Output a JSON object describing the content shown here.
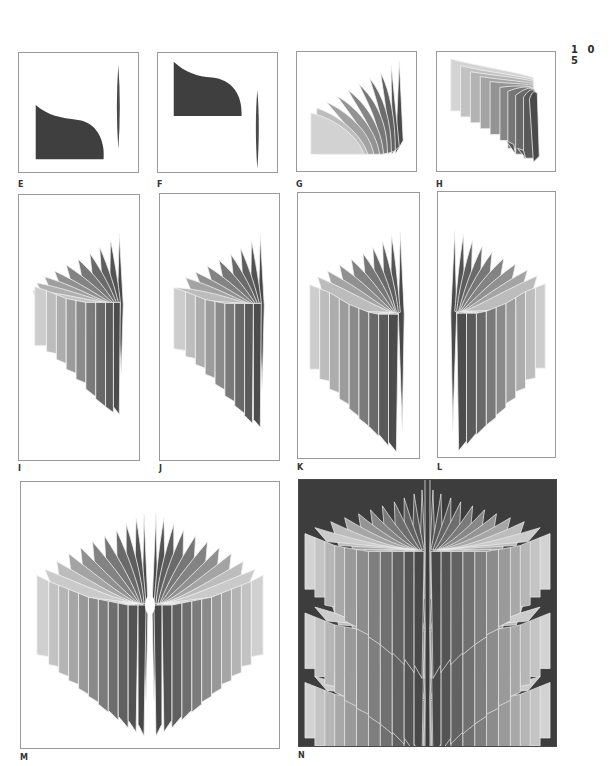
{
  "page": {
    "number": "1 0 5"
  },
  "figures": [
    {
      "id": "E",
      "label": "E",
      "description": "Dark solid curved silhouette with thin vertical spindle to the right"
    },
    {
      "id": "F",
      "label": "F",
      "description": "Dark solid curved silhouette (raised) with thin vertical spindle lower right"
    },
    {
      "id": "G",
      "label": "G",
      "description": "Fan of grey panels from light to dark, bending toward right edge"
    },
    {
      "id": "H",
      "label": "H",
      "description": "Row of grey panels light to dark, tops curving toward right, bottoms pointed"
    },
    {
      "id": "I",
      "label": "I",
      "description": "Half-fan of grey panels converging to right vertical axis"
    },
    {
      "id": "J",
      "label": "J",
      "description": "Half-fan of grey panels converging to right vertical axis, shifted"
    },
    {
      "id": "K",
      "label": "K",
      "description": "Half-fan of panels converging to a central pinch point on the right"
    },
    {
      "id": "L",
      "label": "L",
      "description": "Mirrored half-fan converging to the left"
    },
    {
      "id": "M",
      "label": "M",
      "description": "Full symmetric fan of grey panels converging to bright central point"
    },
    {
      "id": "N",
      "label": "N",
      "description": "Three stacked symmetric fans on a dark background"
    }
  ],
  "colors": {
    "page_bg": "#ffffff",
    "frame_border": "#9a9a9a",
    "dark_fill": "#3f3f3f",
    "panel_light": "#d4d4d4",
    "panel_dark": "#4a4a4a",
    "n_background": "#3d3d3d",
    "panel_edge": "#f2f2f2"
  }
}
